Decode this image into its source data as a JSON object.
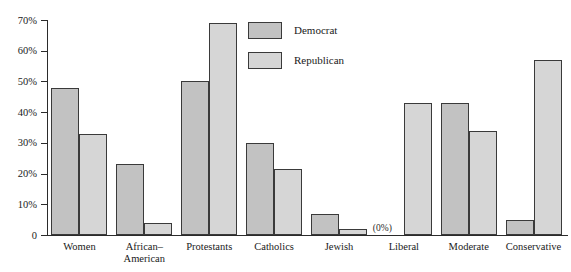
{
  "chart_data": {
    "type": "bar",
    "title": "",
    "subtitle": "",
    "xlabel": "",
    "ylabel": "",
    "ylim": [
      0,
      70
    ],
    "grid": false,
    "legend_position": "top-center",
    "y_ticks": [
      "0",
      "10%",
      "20%",
      "30%",
      "40%",
      "50%",
      "60%",
      "70%"
    ],
    "y_tick_values": [
      0,
      10,
      20,
      30,
      40,
      50,
      60,
      70
    ],
    "categories": [
      "Women",
      "African–American",
      "Protestants",
      "Catholics",
      "Jewish",
      "Liberal",
      "Moderate",
      "Conservative"
    ],
    "category_lines": [
      [
        "Women"
      ],
      [
        "African–",
        "American"
      ],
      [
        "Protestants"
      ],
      [
        "Catholics"
      ],
      [
        "Jewish"
      ],
      [
        "Liberal"
      ],
      [
        "Moderate"
      ],
      [
        "Conservative"
      ]
    ],
    "series": [
      {
        "name": "Democrat",
        "color": "#c2c2c2",
        "values": [
          48,
          23,
          50,
          30,
          7,
          0,
          43,
          5
        ]
      },
      {
        "name": "Republican",
        "color": "#d6d6d6",
        "values": [
          33,
          4,
          69,
          21.5,
          2,
          43,
          34,
          57
        ]
      }
    ],
    "annotations": [
      {
        "text": "(0%)",
        "category": "Liberal",
        "series": "Democrat",
        "note": "marks the absent Democrat bar in the Liberal group"
      }
    ]
  },
  "legend": {
    "items": [
      {
        "label": "Democrat",
        "color": "#c2c2c2"
      },
      {
        "label": "Republican",
        "color": "#d6d6d6"
      }
    ]
  },
  "colors": {
    "democrat": "#c2c2c2",
    "republican": "#d6d6d6",
    "bar_outline": "#3a3a3a",
    "axis": "#2b2b2b",
    "background": "#ffffff"
  }
}
